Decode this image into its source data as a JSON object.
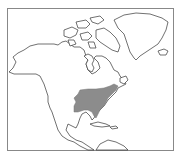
{
  "map": {
    "region": "North America",
    "type": "species distribution map",
    "frame_color": "#888888",
    "coast_color": "#333333",
    "land_fill": "#ffffff",
    "range_fill": "#8c8c8c",
    "shaded_range": {
      "label": "distribution range",
      "area": "eastern United States"
    }
  }
}
